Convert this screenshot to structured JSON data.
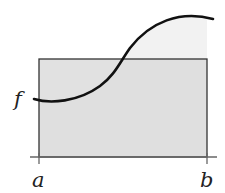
{
  "diagram": {
    "type": "mean-value-theorem-integral",
    "labels": {
      "function": "f",
      "left_bound": "a",
      "right_bound": "b"
    },
    "colors": {
      "under_curve_fill": "#f2f2f2",
      "rectangle_fill": "#dcdcdc",
      "curve_stroke": "#111111",
      "rectangle_stroke": "#333333",
      "axis_stroke": "#666666"
    }
  }
}
